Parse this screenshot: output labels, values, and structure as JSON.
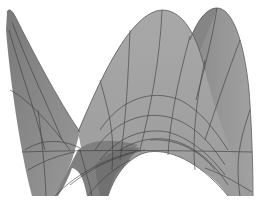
{
  "figure": {
    "kind": "3d-rendered-surface",
    "colors": {
      "background": "#ffffff",
      "surface_light": "#a6a6a6",
      "surface_mid": "#999999",
      "surface_dark": "#7d7d7d",
      "surface_shadow": "#6e6e6e",
      "mesh_line": "#3a3a3a"
    }
  }
}
